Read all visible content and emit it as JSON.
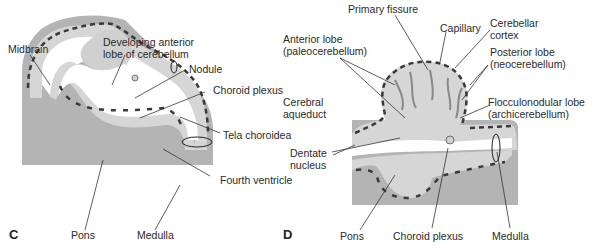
{
  "colors": {
    "tissue_dark": "#b4b4b4",
    "tissue_light": "#d6d6d6",
    "tissue_mid": "#c9c9c9",
    "vessel": "#3a3a3a",
    "leader_line": "#333333",
    "text": "#2a2a2a"
  },
  "panels": [
    {
      "letter": "C",
      "labels": {
        "midbrain": "Midbrain",
        "developing_anterior_lobe": "Developing anterior\nlobe of cerebellum",
        "nodule": "Nodule",
        "choroid_plexus": "Choroid plexus",
        "tela_choroidea": "Tela choroidea",
        "fourth_ventricle": "Fourth ventricle",
        "pons": "Pons",
        "medulla": "Medulla"
      }
    },
    {
      "letter": "D",
      "labels": {
        "primary_fissure": "Primary fissure",
        "capillary": "Capillary",
        "cerebellar_cortex": "Cerebellar\ncortex",
        "anterior_lobe": "Anterior lobe\n(paleocerebellum)",
        "posterior_lobe": "Posterior lobe\n(neocerebellum)",
        "cerebral_aqueduct": "Cerebral\naqueduct",
        "flocculonodular_lobe": "Flocculonodular lobe\n(archicerebellum)",
        "dentate_nucleus": "Dentate\nnucleus",
        "pons": "Pons",
        "choroid_plexus": "Choroid plexus",
        "medulla": "Medulla"
      }
    }
  ]
}
